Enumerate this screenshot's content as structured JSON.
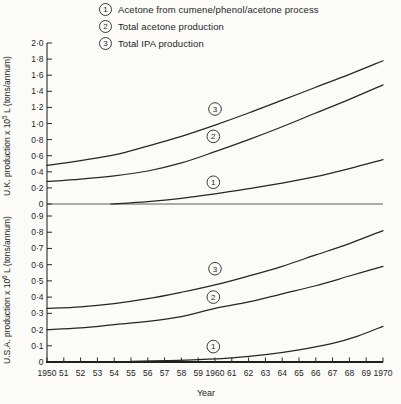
{
  "legend": {
    "items": [
      {
        "num": "1",
        "label": "Acetone from cumene/phenol/acetone process"
      },
      {
        "num": "2",
        "label": "Total acetone production"
      },
      {
        "num": "3",
        "label": "Total IPA production"
      }
    ]
  },
  "chart_data": {
    "type": "line",
    "xlabel": "Year",
    "x_range": [
      1950,
      1970
    ],
    "x_tick_years": [
      1950,
      1951,
      1952,
      1953,
      1954,
      1955,
      1956,
      1957,
      1958,
      1959,
      1960,
      1961,
      1962,
      1963,
      1964,
      1965,
      1966,
      1967,
      1968,
      1969,
      1970
    ],
    "x_tick_labels": [
      "1950",
      "51",
      "52",
      "53",
      "54",
      "55",
      "56",
      "57",
      "58",
      "59",
      "1960",
      "61",
      "62",
      "63",
      "64",
      "65",
      "66",
      "67",
      "68",
      "69",
      "1970"
    ],
    "panels": [
      {
        "id": "uk",
        "ylabel": "U.K. production x 10^5 L (tons/annum)",
        "ylabel_parts": {
          "prefix": "U.K. production x 10",
          "exp": "5",
          "suffix": " L (tons/annum)"
        },
        "ylim": [
          0,
          2.0
        ],
        "ytick_values": [
          2.0,
          1.8,
          1.6,
          1.4,
          1.2,
          1.0,
          0.8,
          0.6,
          0.4,
          0.2,
          0
        ],
        "ytick_labels": [
          "2·0",
          "1·8",
          "1·6",
          "1·4",
          "1·2",
          "1·0",
          "0·8",
          "0·6",
          "0·4",
          "0·2",
          "0"
        ],
        "series": [
          {
            "num": "3",
            "name": "Total IPA production",
            "x": [
              1950,
              1952,
              1954,
              1956,
              1958,
              1960,
              1962,
              1964,
              1966,
              1968,
              1970
            ],
            "y": [
              0.48,
              0.54,
              0.61,
              0.72,
              0.84,
              0.98,
              1.13,
              1.29,
              1.45,
              1.61,
              1.78
            ],
            "annotation": {
              "label": "3",
              "year": 1960,
              "value": 1.18
            }
          },
          {
            "num": "2",
            "name": "Total acetone production",
            "x": [
              1950,
              1952,
              1954,
              1956,
              1958,
              1960,
              1962,
              1964,
              1966,
              1968,
              1970
            ],
            "y": [
              0.28,
              0.31,
              0.35,
              0.41,
              0.51,
              0.65,
              0.8,
              0.96,
              1.13,
              1.3,
              1.48
            ],
            "annotation": {
              "label": "2",
              "year": 1959.9,
              "value": 0.84
            }
          },
          {
            "num": "1",
            "name": "Acetone from cumene/phenol/acetone process",
            "x": [
              1953.8,
              1956,
              1958,
              1960,
              1962,
              1964,
              1966,
              1968,
              1970
            ],
            "y": [
              0.0,
              0.03,
              0.07,
              0.125,
              0.19,
              0.26,
              0.34,
              0.44,
              0.55
            ],
            "annotation": {
              "label": "1",
              "year": 1959.9,
              "value": 0.27
            }
          }
        ]
      },
      {
        "id": "usa",
        "ylabel": "U.S.A. production x 10^6 L (tons/annum)",
        "ylabel_parts": {
          "prefix": "U.S.A. production x 10",
          "exp": "6",
          "suffix": " L (tons/annum)"
        },
        "ylim": [
          0,
          0.9
        ],
        "ytick_values": [
          0.9,
          0.8,
          0.7,
          0.6,
          0.5,
          0.4,
          0.3,
          0.2,
          0.1,
          0
        ],
        "ytick_labels": [
          "0·9",
          "0·8",
          "0·7",
          "0·6",
          "0·5",
          "0·4",
          "0·3",
          "0·2",
          "0·1",
          "0"
        ],
        "series": [
          {
            "num": "3",
            "name": "Total IPA production",
            "x": [
              1950,
              1952,
              1954,
              1956,
              1958,
              1960,
              1962,
              1964,
              1966,
              1968,
              1970
            ],
            "y": [
              0.33,
              0.34,
              0.36,
              0.39,
              0.43,
              0.475,
              0.53,
              0.59,
              0.66,
              0.73,
              0.81
            ],
            "annotation": {
              "label": "3",
              "year": 1960,
              "value": 0.575
            }
          },
          {
            "num": "2",
            "name": "Total acetone production",
            "x": [
              1950,
              1952,
              1954,
              1956,
              1958,
              1960,
              1962,
              1964,
              1966,
              1968,
              1970
            ],
            "y": [
              0.2,
              0.21,
              0.23,
              0.25,
              0.28,
              0.33,
              0.37,
              0.42,
              0.47,
              0.53,
              0.59
            ],
            "annotation": {
              "label": "2",
              "year": 1959.9,
              "value": 0.4
            }
          },
          {
            "num": "1",
            "name": "Acetone from cumene/phenol/acetone process",
            "x": [
              1955,
              1957,
              1959,
              1961,
              1963,
              1965,
              1967,
              1968.5,
              1970
            ],
            "y": [
              0.004,
              0.008,
              0.014,
              0.025,
              0.045,
              0.075,
              0.115,
              0.16,
              0.22
            ],
            "annotation": {
              "label": "1",
              "year": 1959.9,
              "value": 0.095
            }
          }
        ]
      }
    ]
  }
}
